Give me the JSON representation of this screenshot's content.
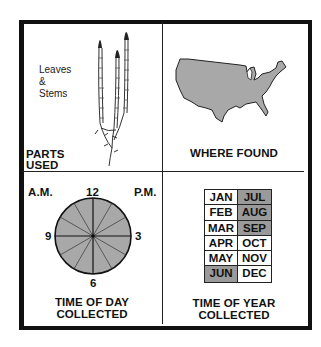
{
  "panels": {
    "parts_used": {
      "title_line1": "PARTS",
      "title_line2": "USED",
      "parts_line1": "Leaves",
      "parts_line2": "&",
      "parts_line3": "Stems",
      "illustration": "horsetail-plant-icon"
    },
    "where_found": {
      "title": "WHERE FOUND",
      "illustration": "usa-map-icon",
      "map_fill": "#a8a8a8"
    },
    "time_of_day": {
      "title_line1": "TIME OF DAY",
      "title_line2": "COLLECTED",
      "am_label": "A.M.",
      "pm_label": "P.M.",
      "tick_12": "12",
      "tick_3": "3",
      "tick_6": "6",
      "tick_9": "9",
      "clock_fill": "#a8a8a8",
      "hours_shaded": "all"
    },
    "time_of_year": {
      "title_line1": "TIME OF YEAR",
      "title_line2": "COLLECTED",
      "shade_color": "#9a9a9a",
      "months": [
        {
          "label": "JAN",
          "collected": false
        },
        {
          "label": "JUL",
          "collected": true
        },
        {
          "label": "FEB",
          "collected": false
        },
        {
          "label": "AUG",
          "collected": true
        },
        {
          "label": "MAR",
          "collected": false
        },
        {
          "label": "SEP",
          "collected": true
        },
        {
          "label": "APR",
          "collected": false
        },
        {
          "label": "OCT",
          "collected": false
        },
        {
          "label": "MAY",
          "collected": false
        },
        {
          "label": "NOV",
          "collected": false
        },
        {
          "label": "JUN",
          "collected": true
        },
        {
          "label": "DEC",
          "collected": false
        }
      ]
    }
  }
}
